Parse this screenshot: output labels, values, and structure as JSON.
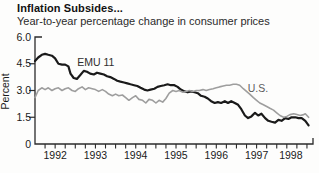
{
  "panel": {
    "background": "#fdfdfc",
    "text_color": "#1a1a1a",
    "axis_color": "#2b2b2b"
  },
  "chart_data": {
    "type": "line",
    "title": "Inflation Subsides...",
    "subtitle": "Year-to-year percentage change in consumer prices",
    "ylabel": "Percent",
    "grid": false,
    "legend_position": "inline-labels",
    "ylim": [
      0,
      6
    ],
    "ytick_values": [
      0,
      1.5,
      3.0,
      4.5,
      6.0
    ],
    "ytick_labels": [
      "0",
      "1.5",
      "3.0",
      "4.5",
      "6.0"
    ],
    "xlim": [
      1992,
      1998.9
    ],
    "quarter_tick_start": 1992.25,
    "quarter_tick_step": 0.25,
    "quarter_tick_end": 1998.75,
    "xtick_labels": [
      "1992",
      "1993",
      "1994",
      "1995",
      "1996",
      "1997",
      "1998"
    ],
    "xtick_label_centers": [
      1992.5,
      1993.5,
      1994.5,
      1995.5,
      1996.5,
      1997.5,
      1998.35
    ],
    "series": [
      {
        "name": "EMU 11",
        "color": "#1a1a1a",
        "line_width": 2.2,
        "label_color": "#2e2e2e",
        "label_pos": {
          "x": 1993.05,
          "y": 4.35
        },
        "points": [
          [
            1992.0,
            4.65
          ],
          [
            1992.08,
            4.85
          ],
          [
            1992.17,
            5.0
          ],
          [
            1992.25,
            5.05
          ],
          [
            1992.33,
            5.0
          ],
          [
            1992.42,
            4.95
          ],
          [
            1992.5,
            4.8
          ],
          [
            1992.58,
            4.5
          ],
          [
            1992.67,
            4.45
          ],
          [
            1992.75,
            4.45
          ],
          [
            1992.83,
            4.35
          ],
          [
            1992.88,
            3.95
          ],
          [
            1992.96,
            3.7
          ],
          [
            1993.04,
            3.65
          ],
          [
            1993.12,
            3.85
          ],
          [
            1993.21,
            4.1
          ],
          [
            1993.29,
            4.05
          ],
          [
            1993.37,
            3.95
          ],
          [
            1993.46,
            3.9
          ],
          [
            1993.54,
            4.0
          ],
          [
            1993.62,
            3.95
          ],
          [
            1993.71,
            3.9
          ],
          [
            1993.79,
            3.8
          ],
          [
            1993.87,
            3.75
          ],
          [
            1993.96,
            3.65
          ],
          [
            1994.04,
            3.55
          ],
          [
            1994.12,
            3.5
          ],
          [
            1994.21,
            3.45
          ],
          [
            1994.29,
            3.4
          ],
          [
            1994.37,
            3.35
          ],
          [
            1994.46,
            3.3
          ],
          [
            1994.54,
            3.25
          ],
          [
            1994.62,
            3.15
          ],
          [
            1994.71,
            3.05
          ],
          [
            1994.79,
            3.0
          ],
          [
            1994.87,
            3.05
          ],
          [
            1994.96,
            3.1
          ],
          [
            1995.04,
            3.2
          ],
          [
            1995.12,
            3.25
          ],
          [
            1995.21,
            3.3
          ],
          [
            1995.29,
            3.35
          ],
          [
            1995.37,
            3.3
          ],
          [
            1995.46,
            3.3
          ],
          [
            1995.54,
            3.2
          ],
          [
            1995.62,
            3.05
          ],
          [
            1995.71,
            2.95
          ],
          [
            1995.79,
            2.9
          ],
          [
            1995.87,
            2.95
          ],
          [
            1995.96,
            2.9
          ],
          [
            1996.04,
            2.85
          ],
          [
            1996.12,
            2.7
          ],
          [
            1996.21,
            2.65
          ],
          [
            1996.29,
            2.55
          ],
          [
            1996.37,
            2.4
          ],
          [
            1996.46,
            2.3
          ],
          [
            1996.54,
            2.35
          ],
          [
            1996.62,
            2.3
          ],
          [
            1996.71,
            2.4
          ],
          [
            1996.79,
            2.3
          ],
          [
            1996.87,
            2.4
          ],
          [
            1996.96,
            2.3
          ],
          [
            1997.04,
            2.2
          ],
          [
            1997.12,
            1.95
          ],
          [
            1997.21,
            1.6
          ],
          [
            1997.29,
            1.45
          ],
          [
            1997.37,
            1.55
          ],
          [
            1997.46,
            1.75
          ],
          [
            1997.54,
            1.6
          ],
          [
            1997.62,
            1.7
          ],
          [
            1997.71,
            1.45
          ],
          [
            1997.79,
            1.3
          ],
          [
            1997.87,
            1.25
          ],
          [
            1997.96,
            1.2
          ],
          [
            1998.04,
            1.35
          ],
          [
            1998.12,
            1.3
          ],
          [
            1998.21,
            1.45
          ],
          [
            1998.29,
            1.4
          ],
          [
            1998.37,
            1.5
          ],
          [
            1998.46,
            1.5
          ],
          [
            1998.54,
            1.45
          ],
          [
            1998.62,
            1.45
          ],
          [
            1998.71,
            1.3
          ],
          [
            1998.79,
            1.05
          ]
        ]
      },
      {
        "name": "U.S.",
        "color": "#9e9e9e",
        "line_width": 1.6,
        "label_color": "#5c5c5c",
        "label_pos": {
          "x": 1997.28,
          "y": 2.9
        },
        "points": [
          [
            1992.0,
            2.6
          ],
          [
            1992.08,
            3.0
          ],
          [
            1992.17,
            3.15
          ],
          [
            1992.25,
            3.05
          ],
          [
            1992.33,
            3.15
          ],
          [
            1992.42,
            3.0
          ],
          [
            1992.5,
            3.1
          ],
          [
            1992.58,
            3.15
          ],
          [
            1992.67,
            3.0
          ],
          [
            1992.75,
            3.1
          ],
          [
            1992.83,
            3.15
          ],
          [
            1992.92,
            3.0
          ],
          [
            1993.0,
            2.95
          ],
          [
            1993.08,
            3.1
          ],
          [
            1993.17,
            3.2
          ],
          [
            1993.25,
            3.05
          ],
          [
            1993.33,
            3.15
          ],
          [
            1993.42,
            3.1
          ],
          [
            1993.5,
            3.05
          ],
          [
            1993.58,
            2.95
          ],
          [
            1993.67,
            3.05
          ],
          [
            1993.75,
            2.95
          ],
          [
            1993.83,
            2.8
          ],
          [
            1993.92,
            2.7
          ],
          [
            1994.0,
            2.8
          ],
          [
            1994.08,
            2.7
          ],
          [
            1994.17,
            2.75
          ],
          [
            1994.25,
            2.6
          ],
          [
            1994.33,
            2.45
          ],
          [
            1994.42,
            2.6
          ],
          [
            1994.5,
            2.7
          ],
          [
            1994.58,
            2.5
          ],
          [
            1994.67,
            2.45
          ],
          [
            1994.75,
            2.3
          ],
          [
            1994.83,
            2.5
          ],
          [
            1994.92,
            2.45
          ],
          [
            1995.0,
            2.3
          ],
          [
            1995.08,
            2.45
          ],
          [
            1995.17,
            2.35
          ],
          [
            1995.25,
            2.55
          ],
          [
            1995.33,
            2.85
          ],
          [
            1995.42,
            3.0
          ],
          [
            1995.5,
            2.95
          ],
          [
            1995.58,
            3.0
          ],
          [
            1995.67,
            2.9
          ],
          [
            1995.75,
            2.95
          ],
          [
            1995.83,
            3.0
          ],
          [
            1995.92,
            2.95
          ],
          [
            1996.0,
            3.0
          ],
          [
            1996.08,
            3.0
          ],
          [
            1996.17,
            3.05
          ],
          [
            1996.25,
            3.0
          ],
          [
            1996.33,
            3.05
          ],
          [
            1996.42,
            3.1
          ],
          [
            1996.5,
            3.15
          ],
          [
            1996.58,
            3.2
          ],
          [
            1996.67,
            3.25
          ],
          [
            1996.75,
            3.3
          ],
          [
            1996.83,
            3.3
          ],
          [
            1996.92,
            3.35
          ],
          [
            1997.0,
            3.35
          ],
          [
            1997.08,
            3.3
          ],
          [
            1997.17,
            3.1
          ],
          [
            1997.25,
            2.95
          ],
          [
            1997.33,
            2.8
          ],
          [
            1997.42,
            2.6
          ],
          [
            1997.5,
            2.45
          ],
          [
            1997.58,
            2.3
          ],
          [
            1997.67,
            2.2
          ],
          [
            1997.75,
            2.1
          ],
          [
            1997.83,
            2.0
          ],
          [
            1997.92,
            1.9
          ],
          [
            1998.0,
            1.75
          ],
          [
            1998.08,
            1.6
          ],
          [
            1998.17,
            1.5
          ],
          [
            1998.25,
            1.55
          ],
          [
            1998.33,
            1.65
          ],
          [
            1998.42,
            1.7
          ],
          [
            1998.5,
            1.65
          ],
          [
            1998.58,
            1.6
          ],
          [
            1998.67,
            1.65
          ],
          [
            1998.71,
            1.7
          ],
          [
            1998.79,
            1.5
          ]
        ]
      }
    ]
  }
}
